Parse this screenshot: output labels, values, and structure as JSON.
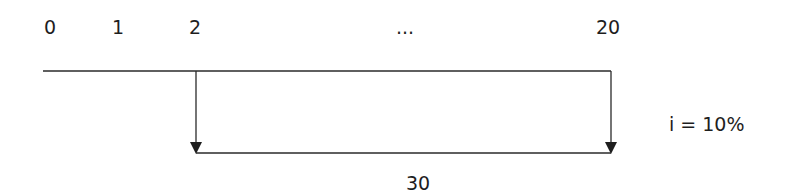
{
  "diagram": {
    "type": "cash-flow-timeline",
    "periods": [
      {
        "label": "0",
        "x": 50
      },
      {
        "label": "1",
        "x": 118
      },
      {
        "label": "2",
        "x": 195
      },
      {
        "label": "...",
        "x": 405
      },
      {
        "label": "20",
        "x": 608
      }
    ],
    "annuity_amount": "30",
    "interest_rate": "i = 10%",
    "cash_flow_start_period": "2",
    "cash_flow_end_period": "20",
    "line_color": "#2a2a2a"
  }
}
